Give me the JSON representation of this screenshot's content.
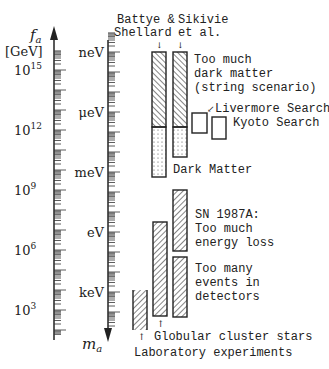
{
  "left_axis": {
    "label_symbol": "f",
    "label_sub": "a",
    "unit": "[GeV]",
    "ticks": [
      {
        "base": "10",
        "exp": "15",
        "y": 70
      },
      {
        "base": "10",
        "exp": "12",
        "y": 130
      },
      {
        "base": "10",
        "exp": "9",
        "y": 190
      },
      {
        "base": "10",
        "exp": "6",
        "y": 250
      },
      {
        "base": "10",
        "exp": "3",
        "y": 310
      }
    ]
  },
  "right_axis": {
    "label_symbol": "m",
    "label_sub": "a",
    "ticks": [
      {
        "label": "neV",
        "y": 52
      },
      {
        "label": "μeV",
        "y": 112
      },
      {
        "label": "meV",
        "y": 172
      },
      {
        "label": "eV",
        "y": 232
      },
      {
        "label": "keV",
        "y": 292
      }
    ]
  },
  "column_headers": {
    "battye": [
      "Battye &",
      "Shellard"
    ],
    "sikivie": [
      "Sikivie",
      "et al."
    ]
  },
  "bars": [
    {
      "name": "battye-shellard-excluded",
      "x": 152,
      "y": 52,
      "w": 14,
      "h": 75,
      "fill": "hatch-back"
    },
    {
      "name": "battye-shellard-dark-matter",
      "x": 152,
      "y": 127,
      "w": 14,
      "h": 50,
      "fill": "dots"
    },
    {
      "name": "sikivie-excluded",
      "x": 173,
      "y": 52,
      "w": 14,
      "h": 75,
      "fill": "hatch-back"
    },
    {
      "name": "sikivie-dark-matter",
      "x": 173,
      "y": 127,
      "w": 14,
      "h": 30,
      "fill": "dots"
    },
    {
      "name": "livermore-search",
      "x": 192,
      "y": 113,
      "w": 15,
      "h": 20,
      "fill": "none"
    },
    {
      "name": "kyoto-search",
      "x": 212,
      "y": 117,
      "w": 14,
      "h": 22,
      "fill": "none"
    },
    {
      "name": "sn1987a-energy-loss",
      "x": 173,
      "y": 190,
      "w": 14,
      "h": 61,
      "fill": "hatch-fwd"
    },
    {
      "name": "sn1987a-detector-events",
      "x": 173,
      "y": 257,
      "w": 14,
      "h": 60,
      "fill": "hatch-fwd"
    },
    {
      "name": "globular-cluster-stars",
      "x": 153,
      "y": 222,
      "w": 14,
      "h": 94,
      "fill": "hatch-fwd"
    },
    {
      "name": "laboratory-experiments",
      "x": 133,
      "y": 290,
      "w": 14,
      "h": 40,
      "fill": "hatch-fwd-open"
    }
  ],
  "annotations": {
    "too_much_dm": [
      "Too much",
      "dark matter",
      "(string scenario)"
    ],
    "livermore": "Livermore Search",
    "kyoto": "Kyoto Search",
    "dark_matter": "Dark Matter",
    "sn1987a": [
      "SN 1987A:",
      "Too much",
      "energy loss"
    ],
    "too_many_events": [
      "Too many",
      "events in",
      "detectors"
    ],
    "globular": "Globular cluster stars",
    "laboratory": "Laboratory experiments"
  },
  "chart_data": {
    "type": "range-bar",
    "title": "",
    "axes": {
      "left": {
        "label": "f_a [GeV]",
        "scale": "log",
        "range": [
          100.0,
          1e+17
        ]
      },
      "right": {
        "label": "m_a",
        "scale": "log",
        "units": [
          "neV",
          "μeV",
          "meV",
          "eV",
          "keV"
        ]
      }
    },
    "series": [
      {
        "name": "Too much dark matter (string scenario) - Battye & Shellard",
        "m_range": [
          "~1 neV",
          "~20 μeV"
        ]
      },
      {
        "name": "Too much dark matter (string scenario) - Sikivie et al.",
        "m_range": [
          "~1 neV",
          "~20 μeV"
        ]
      },
      {
        "name": "Dark Matter - Battye & Shellard",
        "m_range": [
          "~20 μeV",
          "~1 meV"
        ]
      },
      {
        "name": "Dark Matter - Sikivie et al.",
        "m_range": [
          "~20 μeV",
          "~0.1 meV"
        ]
      },
      {
        "name": "Livermore Search",
        "m_range": [
          "~1 μeV",
          "~10 μeV"
        ]
      },
      {
        "name": "Kyoto Search",
        "m_range": [
          "~2 μeV",
          "~20 μeV"
        ]
      },
      {
        "name": "SN 1987A: Too much energy loss",
        "m_range": [
          "~10 meV",
          "~2 eV"
        ]
      },
      {
        "name": "SN 1987A: Too many events in detectors",
        "m_range": [
          "~3 eV",
          "~100 eV"
        ]
      },
      {
        "name": "Globular cluster stars",
        "m_range": [
          "~0.5 eV",
          "~100 eV"
        ]
      },
      {
        "name": "Laboratory experiments",
        "m_range": [
          "~1 keV",
          ">10 keV"
        ]
      }
    ]
  }
}
